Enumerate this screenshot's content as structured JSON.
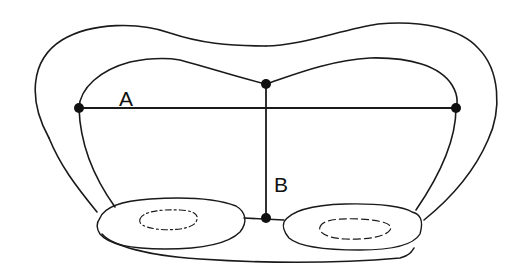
{
  "diagram": {
    "type": "anatomical cross-section line drawing",
    "colors": {
      "stroke": "#1a1a1a",
      "background": "#ffffff"
    },
    "measurements": [
      {
        "id": "A",
        "label": "A",
        "description": "horizontal width between two lateral points of inner contour"
      },
      {
        "id": "B",
        "label": "B",
        "description": "vertical height from top midpoint of inner contour to base"
      }
    ],
    "points": [
      {
        "name": "A-left",
        "x": 79,
        "y": 108
      },
      {
        "name": "A-right",
        "x": 456,
        "y": 108
      },
      {
        "name": "B-top",
        "x": 266,
        "y": 84
      },
      {
        "name": "B-bottom",
        "x": 266,
        "y": 218
      }
    ],
    "label_positions": {
      "A": {
        "x": 119,
        "y": 88
      },
      "B": {
        "x": 274,
        "y": 174
      }
    }
  }
}
